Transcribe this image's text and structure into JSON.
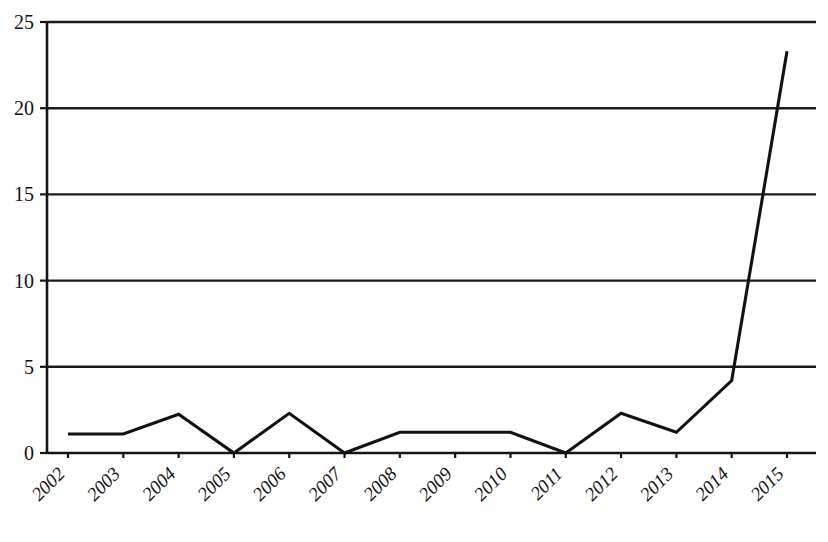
{
  "chart_data": {
    "type": "line",
    "title": "",
    "subtitle": "",
    "xlabel": "",
    "ylabel": "",
    "categories": [
      "2002",
      "2003",
      "2004",
      "2005",
      "2006",
      "2007",
      "2008",
      "2009",
      "2010",
      "2011",
      "2012",
      "2013",
      "2014",
      "2015"
    ],
    "values": [
      1.1,
      1.1,
      2.25,
      0,
      2.3,
      0,
      1.2,
      1.2,
      1.2,
      0,
      2.3,
      1.2,
      4.2,
      23.3
    ],
    "series": [
      {
        "name": "series-1",
        "values": [
          1.1,
          1.1,
          2.25,
          0,
          2.3,
          0,
          1.2,
          1.2,
          1.2,
          0,
          2.3,
          1.2,
          4.2,
          23.3
        ],
        "color": "#121212"
      }
    ],
    "ylim": [
      0,
      25
    ],
    "yticks": [
      0,
      5,
      10,
      15,
      20,
      25
    ],
    "ytick_labels": [
      "0",
      "5",
      "10",
      "15",
      "20",
      "25"
    ],
    "xtick_labels": [
      "2002",
      "2003",
      "2004",
      "2005",
      "2006",
      "2007",
      "2008",
      "2009",
      "2010",
      "2011",
      "2012",
      "2013",
      "2014",
      "2015"
    ],
    "xtick_rotation_deg": -45,
    "grid": true,
    "grid_axis": "y",
    "legend": false,
    "legend_position": "none",
    "annotations": [],
    "line_color": "#121212",
    "background_color": "#ffffff",
    "markers": false
  },
  "axes": {
    "y_axis_name": "y-axis",
    "x_axis_name": "x-axis"
  }
}
